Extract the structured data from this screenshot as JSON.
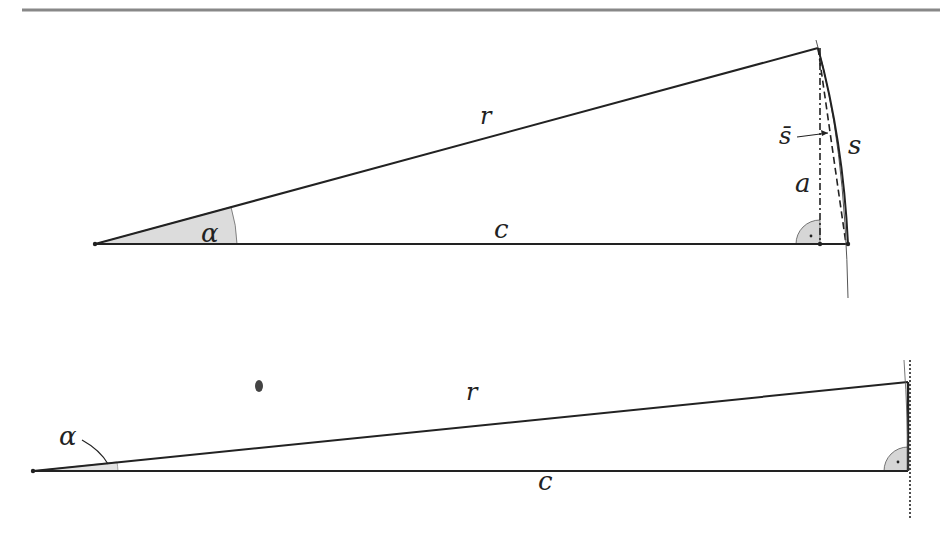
{
  "figure": {
    "top_diagram": {
      "labels": {
        "radius": "r",
        "adjacent": "c",
        "angle": "α",
        "opposite": "a",
        "arc": "s",
        "chord_label": "s̄"
      },
      "points": {
        "origin": [
          95,
          244
        ],
        "apex": [
          818,
          48
        ],
        "foot": [
          820,
          244
        ],
        "arc_end": [
          848,
          244
        ]
      }
    },
    "bottom_diagram": {
      "labels": {
        "radius": "r",
        "adjacent": "c",
        "angle": "α"
      },
      "points": {
        "origin": [
          33,
          471
        ],
        "apex": [
          908,
          382
        ],
        "foot": [
          908,
          471
        ]
      }
    },
    "colors": {
      "line": "#222222",
      "rule": "#888888",
      "angle_fill": "#d9d9d9"
    }
  }
}
